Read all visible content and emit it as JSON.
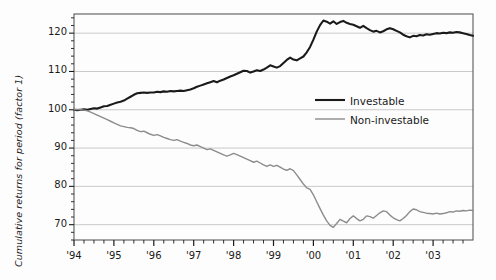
{
  "chart_data": {
    "type": "line",
    "title": "",
    "subtitle": "",
    "xlabel": "",
    "ylabel": "Cumulative returns for period (factor 1)",
    "ylim": [
      66,
      125
    ],
    "xlim": [
      1994.0,
      2004.0
    ],
    "yticks": [
      70,
      80,
      90,
      100,
      110,
      120
    ],
    "ytick_labels": [
      "70",
      "80",
      "90",
      "100",
      "110",
      "120"
    ],
    "xticks": [
      1994,
      1995,
      1996,
      1997,
      1998,
      1999,
      2000,
      2001,
      2002,
      2003
    ],
    "xtick_labels": [
      "'94",
      "'95",
      "'96",
      "'97",
      "'98",
      "'99",
      "'00",
      "'01",
      "'02",
      "'03"
    ],
    "minor_ticks_per_interval": 4,
    "grid": true,
    "grid_axis": "y",
    "grid_color": "#c9c9c9",
    "frame_color": "#5a5a5a",
    "background_color": "#fdfdfd",
    "legend_position": "center-right",
    "series": [
      {
        "name": "Investable",
        "color": "#1a1a1a",
        "line_width": 2.1,
        "x": [
          1994.0,
          1994.083,
          1994.167,
          1994.25,
          1994.333,
          1994.417,
          1994.5,
          1994.583,
          1994.667,
          1994.75,
          1994.833,
          1994.917,
          1995.0,
          1995.083,
          1995.167,
          1995.25,
          1995.333,
          1995.417,
          1995.5,
          1995.583,
          1995.667,
          1995.75,
          1995.833,
          1995.917,
          1996.0,
          1996.083,
          1996.167,
          1996.25,
          1996.333,
          1996.417,
          1996.5,
          1996.583,
          1996.667,
          1996.75,
          1996.833,
          1996.917,
          1997.0,
          1997.083,
          1997.167,
          1997.25,
          1997.333,
          1997.417,
          1997.5,
          1997.583,
          1997.667,
          1997.75,
          1997.833,
          1997.917,
          1998.0,
          1998.083,
          1998.167,
          1998.25,
          1998.333,
          1998.417,
          1998.5,
          1998.583,
          1998.667,
          1998.75,
          1998.833,
          1998.917,
          1999.0,
          1999.083,
          1999.167,
          1999.25,
          1999.333,
          1999.417,
          1999.5,
          1999.583,
          1999.667,
          1999.75,
          1999.833,
          1999.917,
          2000.0,
          2000.083,
          2000.167,
          2000.25,
          2000.333,
          2000.417,
          2000.5,
          2000.583,
          2000.667,
          2000.75,
          2000.833,
          2000.917,
          2001.0,
          2001.083,
          2001.167,
          2001.25,
          2001.333,
          2001.417,
          2001.5,
          2001.583,
          2001.667,
          2001.75,
          2001.833,
          2001.917,
          2002.0,
          2002.083,
          2002.167,
          2002.25,
          2002.333,
          2002.417,
          2002.5,
          2002.583,
          2002.667,
          2002.75,
          2002.833,
          2002.917,
          2003.0,
          2003.083,
          2003.167,
          2003.25,
          2003.333,
          2003.417,
          2003.5,
          2003.583,
          2003.667,
          2003.75,
          2003.833,
          2003.917,
          2004.0
        ],
        "y": [
          100.0,
          99.9,
          100.0,
          100.1,
          100.0,
          100.2,
          100.4,
          100.3,
          100.6,
          100.9,
          101.0,
          101.3,
          101.6,
          101.9,
          102.1,
          102.4,
          102.9,
          103.4,
          103.9,
          104.3,
          104.4,
          104.5,
          104.4,
          104.5,
          104.5,
          104.7,
          104.6,
          104.8,
          104.7,
          104.9,
          104.8,
          104.9,
          105.0,
          104.9,
          105.1,
          105.3,
          105.6,
          106.0,
          106.3,
          106.6,
          106.9,
          107.2,
          107.5,
          107.2,
          107.6,
          107.9,
          108.3,
          108.7,
          109.0,
          109.4,
          109.8,
          110.2,
          110.1,
          109.7,
          110.0,
          110.3,
          110.1,
          110.5,
          111.0,
          111.6,
          111.3,
          111.0,
          111.4,
          112.2,
          113.0,
          113.6,
          113.1,
          112.9,
          113.4,
          113.9,
          115.0,
          116.4,
          118.3,
          120.4,
          122.1,
          123.3,
          123.0,
          122.5,
          123.1,
          122.4,
          122.9,
          123.2,
          122.7,
          122.4,
          122.2,
          121.8,
          121.4,
          121.9,
          121.3,
          120.8,
          120.4,
          120.6,
          120.2,
          120.5,
          121.0,
          121.3,
          121.0,
          120.6,
          120.2,
          119.6,
          119.2,
          118.9,
          119.3,
          119.2,
          119.5,
          119.4,
          119.7,
          119.6,
          119.8,
          120.0,
          119.9,
          120.1,
          120.0,
          120.2,
          120.1,
          120.3,
          120.2,
          120.0,
          119.8,
          119.5,
          119.3
        ]
      },
      {
        "name": "Non-investable",
        "color": "#8c8c8c",
        "line_width": 1.4,
        "x": [
          1994.0,
          1994.083,
          1994.167,
          1994.25,
          1994.333,
          1994.417,
          1994.5,
          1994.583,
          1994.667,
          1994.75,
          1994.833,
          1994.917,
          1995.0,
          1995.083,
          1995.167,
          1995.25,
          1995.333,
          1995.417,
          1995.5,
          1995.583,
          1995.667,
          1995.75,
          1995.833,
          1995.917,
          1996.0,
          1996.083,
          1996.167,
          1996.25,
          1996.333,
          1996.417,
          1996.5,
          1996.583,
          1996.667,
          1996.75,
          1996.833,
          1996.917,
          1997.0,
          1997.083,
          1997.167,
          1997.25,
          1997.333,
          1997.417,
          1997.5,
          1997.583,
          1997.667,
          1997.75,
          1997.833,
          1997.917,
          1998.0,
          1998.083,
          1998.167,
          1998.25,
          1998.333,
          1998.417,
          1998.5,
          1998.583,
          1998.667,
          1998.75,
          1998.833,
          1998.917,
          1999.0,
          1999.083,
          1999.167,
          1999.25,
          1999.333,
          1999.417,
          1999.5,
          1999.583,
          1999.667,
          1999.75,
          1999.833,
          1999.917,
          2000.0,
          2000.083,
          2000.167,
          2000.25,
          2000.333,
          2000.417,
          2000.5,
          2000.583,
          2000.667,
          2000.75,
          2000.833,
          2000.917,
          2001.0,
          2001.083,
          2001.167,
          2001.25,
          2001.333,
          2001.417,
          2001.5,
          2001.583,
          2001.667,
          2001.75,
          2001.833,
          2001.917,
          2002.0,
          2002.083,
          2002.167,
          2002.25,
          2002.333,
          2002.417,
          2002.5,
          2002.583,
          2002.667,
          2002.75,
          2002.833,
          2002.917,
          2003.0,
          2003.083,
          2003.167,
          2003.25,
          2003.333,
          2003.417,
          2003.5,
          2003.583,
          2003.667,
          2003.75,
          2003.833,
          2003.917,
          2004.0
        ],
        "y": [
          100.0,
          100.1,
          100.0,
          99.9,
          99.7,
          99.4,
          99.0,
          98.6,
          98.2,
          97.8,
          97.4,
          97.0,
          96.6,
          96.2,
          95.8,
          95.6,
          95.4,
          95.3,
          95.1,
          94.6,
          94.3,
          94.4,
          94.0,
          93.6,
          93.3,
          93.5,
          93.2,
          92.8,
          92.5,
          92.2,
          92.0,
          92.2,
          91.8,
          91.5,
          91.2,
          90.8,
          90.6,
          90.8,
          90.4,
          90.0,
          89.6,
          89.8,
          89.4,
          89.0,
          88.6,
          88.2,
          87.9,
          88.2,
          88.6,
          88.3,
          87.9,
          87.5,
          87.1,
          86.7,
          86.3,
          86.6,
          86.1,
          85.6,
          85.2,
          85.6,
          85.2,
          85.5,
          85.0,
          84.5,
          84.2,
          84.6,
          84.1,
          83.0,
          81.8,
          80.6,
          79.6,
          79.2,
          77.8,
          76.0,
          74.2,
          72.5,
          71.0,
          69.8,
          69.3,
          70.3,
          71.4,
          70.9,
          70.5,
          71.6,
          72.3,
          71.6,
          71.0,
          71.4,
          72.3,
          72.1,
          71.7,
          72.4,
          73.1,
          73.6,
          73.4,
          72.5,
          71.8,
          71.3,
          71.0,
          71.6,
          72.4,
          73.4,
          74.1,
          73.9,
          73.4,
          73.2,
          73.0,
          72.9,
          72.8,
          73.0,
          72.8,
          72.9,
          73.1,
          73.4,
          73.3,
          73.6,
          73.5,
          73.7,
          73.6,
          73.8,
          73.7
        ]
      }
    ]
  },
  "legend": {
    "items": [
      {
        "label": "Investable"
      },
      {
        "label": "Non-investable"
      }
    ]
  },
  "axes": {
    "y_axis_title": "Cumulative returns for period (factor 1)"
  }
}
